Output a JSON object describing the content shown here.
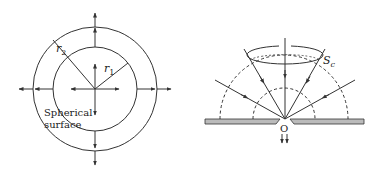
{
  "left_diagram": {
    "description": "Point source with concentric spherical surfaces and outward radial arrows",
    "labels": {
      "r1": "r",
      "r1_sub": "1",
      "r2": "r",
      "r2_sub": "2",
      "surface_line1": "Spherical",
      "surface_line2": "surface"
    },
    "center": [
      95,
      89
    ],
    "outer_radius": 62,
    "inner_radius": 42
  },
  "right_diagram": {
    "description": "Rays converging through a cone onto an aperture O in a plate, with dashed hemispherical wavefronts",
    "labels": {
      "cone": "S",
      "cone_sub": "c",
      "origin": "O"
    },
    "origin": [
      284,
      119
    ],
    "outer_dashed_radius": 64,
    "inner_dashed_radius": 31
  },
  "colors": {
    "line": "#333333",
    "plate_fill": "#bbbbbb"
  }
}
